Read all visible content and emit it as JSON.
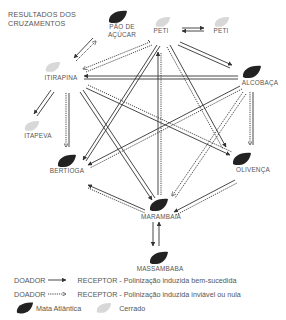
{
  "title": [
    "RESULTADOS DOS",
    "CRUZAMENTOS"
  ],
  "colors": {
    "mata_atlantica": "#222222",
    "cerrado": "#d6d6d6",
    "arrow": "#333333",
    "text": "#555555"
  },
  "nodes": [
    {
      "id": "pao_de_acucar",
      "label_lines": [
        "PÃO DE",
        "AÇÚCAR"
      ],
      "biome": "mata_atlantica"
    },
    {
      "id": "peti_1",
      "label": "PETI",
      "biome": "cerrado"
    },
    {
      "id": "peti_2",
      "label": "PETI",
      "biome": "cerrado"
    },
    {
      "id": "itirapina",
      "label": "ITIRAPINA",
      "biome": "cerrado"
    },
    {
      "id": "alcobaca",
      "label": "ALCOBAÇA",
      "biome": "mata_atlantica"
    },
    {
      "id": "itapeva",
      "label": "ITAPEVA",
      "biome": "cerrado"
    },
    {
      "id": "bertioga",
      "label": "BERTIOGA",
      "biome": "mata_atlantica"
    },
    {
      "id": "olivenca",
      "label": "OLIVENÇA",
      "biome": "mata_atlantica"
    },
    {
      "id": "marambaia",
      "label": "MARAMBAIA",
      "biome": "mata_atlantica"
    },
    {
      "id": "massambaba",
      "label": "MASSAMBABA",
      "biome": "mata_atlantica"
    }
  ],
  "legend": {
    "success": {
      "donor": "DOADOR",
      "receptor": "RECEPTOR - Polinização induzida bem-sucedida"
    },
    "failure": {
      "donor": "DOADOR",
      "receptor": "RECEPTOR - Polinização induzida inviável ou nula"
    },
    "biomes": [
      {
        "id": "mata_atlantica",
        "label": "Mata Atlântica"
      },
      {
        "id": "cerrado",
        "label": "Cerrado"
      }
    ]
  }
}
